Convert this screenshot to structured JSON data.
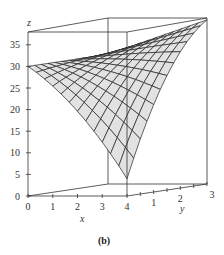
{
  "figure": {
    "caption": "(b)"
  },
  "chart_data": {
    "type": "surface",
    "title": "",
    "caption": "(b)",
    "xlabel": "x",
    "ylabel": "y",
    "zlabel": "z",
    "xlim": [
      0,
      4
    ],
    "ylim": [
      0,
      3
    ],
    "zlim": [
      0,
      38
    ],
    "x_ticks": [
      0,
      1,
      2,
      3,
      4
    ],
    "y_ticks": [
      1,
      2,
      3
    ],
    "y_minor_ticks": [
      0.5,
      1,
      1.5,
      2,
      2.5,
      3
    ],
    "z_ticks": [
      0,
      5,
      10,
      15,
      20,
      25,
      30,
      35
    ],
    "grid": false,
    "box": true,
    "surface_grid": {
      "nx": 12,
      "ny": 12
    },
    "surface_description": "Saddle-shaped wireframe surface: z≈30 at (0,0), rises to ≈38 at (4,3), dips to ≈5 near the front edge (x≈3–4, y≈0).",
    "key_points": [
      {
        "x": 0,
        "y": 0,
        "z": 30
      },
      {
        "x": 0,
        "y": 3,
        "z": 30
      },
      {
        "x": 4,
        "y": 3,
        "z": 38
      },
      {
        "x": 4,
        "y": 0,
        "z": 4
      },
      {
        "x": 3,
        "y": 0,
        "z": 7
      },
      {
        "x": 2,
        "y": 1.5,
        "z": 25
      }
    ]
  },
  "axes": {
    "z_tick_labels": [
      "0",
      "5",
      "10",
      "15",
      "20",
      "25",
      "30",
      "35"
    ],
    "x_tick_labels": [
      "0",
      "1",
      "2",
      "3",
      "4"
    ],
    "y_tick_labels": [
      "1",
      "2",
      "3"
    ],
    "x_label": "x",
    "y_label": "y",
    "z_label": "z"
  }
}
